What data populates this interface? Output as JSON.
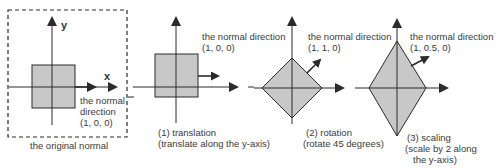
{
  "colors": {
    "stroke": "#2b2b2b",
    "fill": "#c8c8c8",
    "background": "#ffffff"
  },
  "panels": [
    {
      "id": "original",
      "axis_labels": {
        "x": "x",
        "y": "y"
      },
      "normal_label": [
        "the normal",
        "direction",
        "(1, 0, 0)"
      ],
      "caption": [
        "the original normal"
      ]
    },
    {
      "id": "translation",
      "normal_label": [
        "the normal direction",
        "(1, 0, 0)"
      ],
      "caption": [
        "(1) translation",
        "(translate along the y-axis)"
      ]
    },
    {
      "id": "rotation",
      "normal_label": [
        "the normal direction",
        "(1, 1, 0)"
      ],
      "caption": [
        "(2) rotation",
        "(rotate 45 degrees)"
      ]
    },
    {
      "id": "scaling",
      "normal_label": [
        "the normal direction",
        "(1, 0.5, 0)"
      ],
      "caption": [
        "(3) scaling",
        "(scale by 2 along",
        "the y-axis)"
      ]
    }
  ]
}
